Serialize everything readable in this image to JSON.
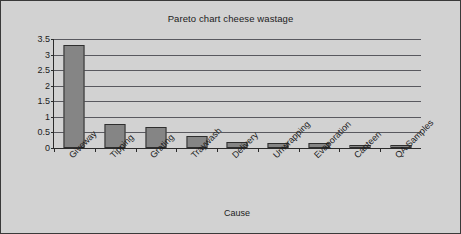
{
  "chart_data": {
    "type": "bar",
    "title": "Pareto chart cheese wastage",
    "xlabel": "Cause",
    "ylabel": "Percentage of total cheese usage",
    "categories": [
      "Giveway",
      "Tipping",
      "Grating",
      "Traywash",
      "Delivery",
      "Unwrapping",
      "Evaporation",
      "Canteen",
      "QA Samples"
    ],
    "values": [
      3.3,
      0.78,
      0.68,
      0.38,
      0.18,
      0.17,
      0.17,
      0.08,
      0.08
    ],
    "ylim": [
      0,
      3.5
    ],
    "yticks": [
      0,
      0.5,
      1,
      1.5,
      2,
      2.5,
      3,
      3.5
    ],
    "ytick_labels": [
      "0",
      "0.5",
      "1",
      "1.5",
      "2",
      "2.5",
      "3",
      "3.5"
    ],
    "grid": true,
    "legend": null,
    "colors": {
      "bar_fill": "#858585",
      "bar_edge": "#2e2e2e",
      "plot_background": "#d2d2d2",
      "figure_background": "#d2d2d2",
      "gridline": "#59595f",
      "axis": "#2b2b2b",
      "text": "#1c1c1c",
      "frame_border": "#3a3a3a"
    }
  }
}
